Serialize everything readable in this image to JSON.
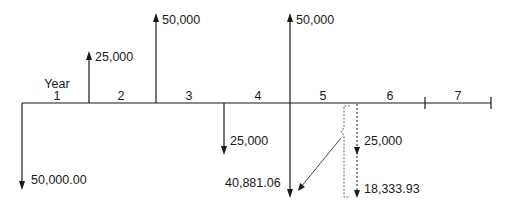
{
  "diagram": {
    "type": "cash-flow-diagram",
    "axis_label": "Year",
    "periods": [
      "1",
      "2",
      "3",
      "4",
      "5",
      "6",
      "7"
    ],
    "inflows": [
      {
        "at_boundary": "end of year 1",
        "label": "25,000"
      },
      {
        "at_boundary": "end of year 2",
        "label": "50,000"
      },
      {
        "at_boundary": "end of year 4",
        "label": "50,000"
      }
    ],
    "outflows": [
      {
        "at_boundary": "start of year 1",
        "label": "50,000.00"
      },
      {
        "at_boundary": "end of year 3",
        "label": "25,000"
      },
      {
        "at_boundary": "end of year 4",
        "label": "40,881.06"
      }
    ],
    "dashed_outflows": [
      {
        "position": "mid year 5",
        "label": "25,000"
      },
      {
        "position": "mid year 5",
        "label": "18,333.93"
      }
    ],
    "brace_note": "dashed flows in year 5 grouped and transferred to end of year 4 (40,881.06)"
  }
}
